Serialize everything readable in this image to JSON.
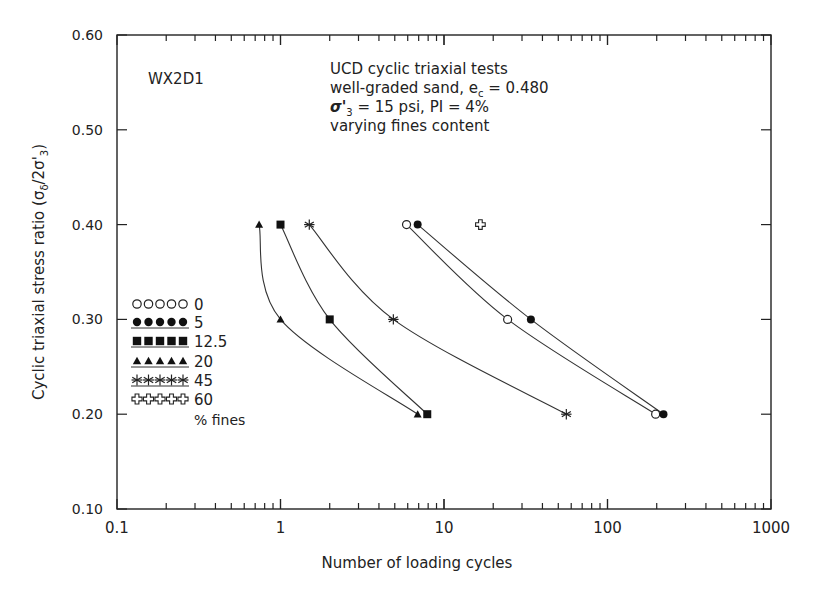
{
  "chart_data": {
    "type": "scatter",
    "title": "",
    "xlabel": "Number of loading cycles",
    "ylabel": "Cyclic triaxial stress ratio (σδ/2σ'3)",
    "xscale": "log",
    "xlim": [
      0.1,
      1000
    ],
    "ylim": [
      0.1,
      0.6
    ],
    "x_ticks": [
      "0.1",
      "1",
      "10",
      "100",
      "1000"
    ],
    "y_ticks": [
      "0.10",
      "0.20",
      "0.30",
      "0.40",
      "0.50",
      "0.60"
    ],
    "grid": false,
    "legend_position": "left-middle inside",
    "legend_title": "% fines",
    "annotations": {
      "specimen_id": "WX2D1",
      "lines": [
        "UCD cyclic triaxial tests",
        "well-graded sand, ec = 0.480",
        "σ'3 = 15 psi, PI = 4%",
        "varying fines content"
      ]
    },
    "series": [
      {
        "name": "0",
        "marker": "open-circle",
        "points": [
          [
            5.9,
            0.4
          ],
          [
            24.5,
            0.3
          ],
          [
            197,
            0.2
          ]
        ],
        "fit_curve": true
      },
      {
        "name": "5",
        "marker": "filled-circle",
        "points": [
          [
            6.9,
            0.4
          ],
          [
            34,
            0.3
          ],
          [
            220,
            0.2
          ]
        ],
        "fit_curve": true
      },
      {
        "name": "12.5",
        "marker": "filled-square",
        "points": [
          [
            1.0,
            0.4
          ],
          [
            2.0,
            0.3
          ],
          [
            7.9,
            0.2
          ]
        ],
        "fit_curve": true
      },
      {
        "name": "20",
        "marker": "filled-triangle",
        "points": [
          [
            0.74,
            0.4
          ],
          [
            1.0,
            0.3
          ],
          [
            6.9,
            0.2
          ]
        ],
        "fit_curve": true
      },
      {
        "name": "45",
        "marker": "asterisk",
        "points": [
          [
            1.5,
            0.4
          ],
          [
            4.9,
            0.3
          ],
          [
            56,
            0.2
          ]
        ],
        "fit_curve": true
      },
      {
        "name": "60",
        "marker": "open-cross",
        "points": [
          [
            16.7,
            0.4
          ]
        ],
        "fit_curve": false
      }
    ]
  },
  "text": {
    "specimen_id": "WX2D1",
    "info_line1": "UCD cyclic triaxial tests",
    "info_line2_pre": "well-graded sand, e",
    "info_line2_sub": "c",
    "info_line2_post": " = 0.480",
    "info_line3_sigma": "σ'",
    "info_line3_sub": "3",
    "info_line3_post": " = 15 psi, PI = 4%",
    "info_line4": "varying fines content",
    "xlabel": "Number of loading cycles",
    "ylabel_main": "Cyclic triaxial stress ratio  (σ",
    "ylabel_sub1": "δ",
    "ylabel_mid": "/2σ'",
    "ylabel_sub2": "3",
    "ylabel_end": ")",
    "legend_footer": "% fines"
  }
}
